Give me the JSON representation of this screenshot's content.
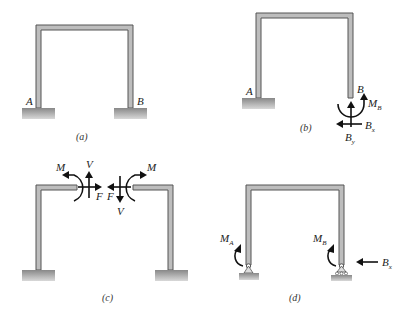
{
  "panels": [
    {
      "id": "a",
      "caption": "(a)",
      "labels": {
        "left_support": "A",
        "right_support": "B"
      }
    },
    {
      "id": "b",
      "caption": "(b)",
      "labels": {
        "left_support": "A",
        "right_end": "B",
        "moment": "M",
        "moment_sub": "B",
        "horizontal": "B",
        "horizontal_sub": "x",
        "vertical": "B",
        "vertical_sub": "y"
      }
    },
    {
      "id": "c",
      "caption": "(c)",
      "labels": {
        "moment_left": "M",
        "shear_left": "V",
        "axial_left": "F",
        "axial_right": "F",
        "shear_right": "V",
        "moment_right": "M"
      }
    },
    {
      "id": "d",
      "caption": "(d)",
      "labels": {
        "moment_a": "M",
        "moment_a_sub": "A",
        "moment_b": "M",
        "moment_b_sub": "B",
        "horizontal": "B",
        "horizontal_sub": "x"
      }
    }
  ]
}
